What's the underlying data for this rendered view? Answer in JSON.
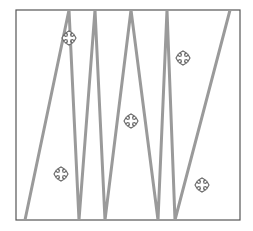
{
  "figure": {
    "frame": {
      "x": 16,
      "y": 10,
      "width": 224,
      "height": 210,
      "stroke": "#555555"
    },
    "zigzag": {
      "stroke": "#9a9a9a",
      "width": 3,
      "points": [
        [
          25,
          220
        ],
        [
          69,
          10
        ],
        [
          79,
          220
        ],
        [
          95,
          10
        ],
        [
          105,
          220
        ],
        [
          131,
          10
        ],
        [
          158,
          220
        ],
        [
          167,
          10
        ],
        [
          175,
          220
        ],
        [
          230,
          10
        ]
      ]
    },
    "markers": {
      "icon": "cross-move-icon",
      "stroke": "#666666",
      "size": 14,
      "positions": [
        [
          69,
          38
        ],
        [
          183,
          58
        ],
        [
          131,
          121
        ],
        [
          61,
          174
        ],
        [
          202,
          185
        ]
      ]
    }
  }
}
